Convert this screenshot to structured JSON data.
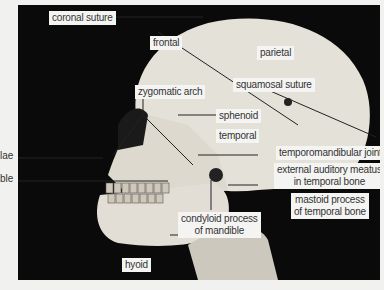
{
  "figure": {
    "colors": {
      "background": "#f1f1ef",
      "photo_background": "#0a0a0a",
      "bone": "#e6e3da",
      "label_bg": "#f4f4f2",
      "leader_line": "#222222"
    }
  },
  "labels": {
    "coronal_suture": "coronal suture",
    "frontal": "frontal",
    "parietal": "parietal",
    "squamosal_suture": "squamosal suture",
    "zygomatic_arch": "zygomatic arch",
    "sphenoid": "sphenoid",
    "temporal": "temporal",
    "temporomandibular_joint": "temporomandibular joint",
    "external_auditory_meatus_1": "external auditory meatus",
    "external_auditory_meatus_2": "in temporal bone",
    "mastoid_process_1": "mastoid process",
    "mastoid_process_2": "of temporal bone",
    "condyloid_process_1": "condyloid process",
    "condyloid_process_2": "of mandible",
    "hyoid": "hyoid",
    "cut_left_1": "lae",
    "cut_left_2": "ble"
  }
}
